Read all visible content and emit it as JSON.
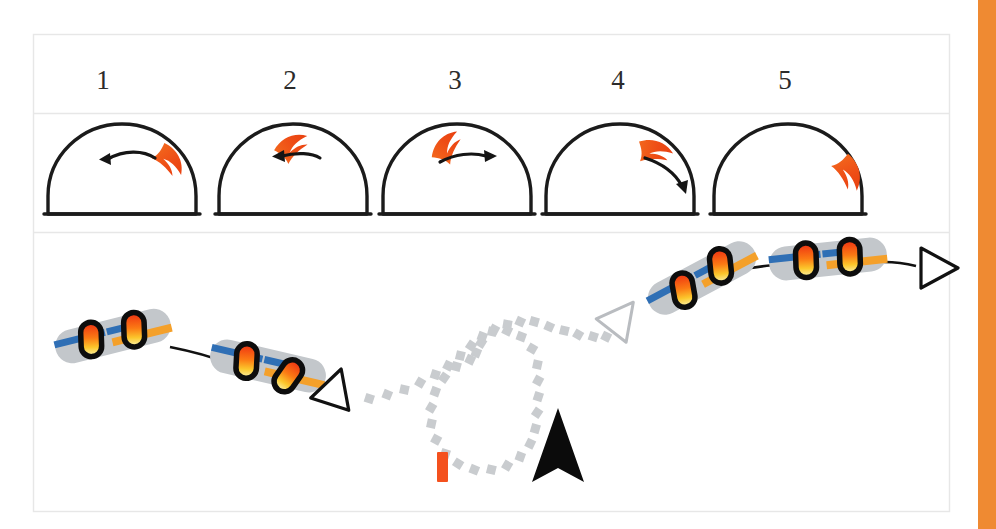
{
  "figure": {
    "background_color": "#ffffff",
    "accent_color": "#ef8a32"
  },
  "table": {
    "border_color": "#e7e7e7",
    "frame": {
      "x": 33,
      "y": 34,
      "width": 917,
      "height": 478
    },
    "row_divider_y": [
      113,
      232
    ],
    "header_row": {
      "name": "step-numbers",
      "cells": [
        {
          "label": "1",
          "cx": 103
        },
        {
          "label": "2",
          "cx": 290
        },
        {
          "label": "3",
          "cx": 455
        },
        {
          "label": "4",
          "cx": 618
        },
        {
          "label": "5",
          "cx": 785
        }
      ]
    }
  },
  "wind_window_row": {
    "name": "wind-window-domes",
    "dome_color": "#1b1b1b",
    "kite_color": "#ee5a1f",
    "arrow_color": "#151515",
    "cells": [
      {
        "step": "1",
        "kite_position": "right-of-zenith",
        "arrow_direction": "left",
        "description": "Kite right of zenith, steering arrow curving left toward zenith"
      },
      {
        "step": "2",
        "kite_position": "zenith",
        "arrow_direction": "left",
        "description": "Kite at zenith, arrow pointing left"
      },
      {
        "step": "3",
        "kite_position": "left-of-zenith",
        "arrow_direction": "right",
        "description": "Kite left of zenith, arrow pointing right"
      },
      {
        "step": "4",
        "kite_position": "upper-right",
        "arrow_direction": "down-right",
        "description": "Kite upper right, arrow curving down toward window edge"
      },
      {
        "step": "5",
        "kite_position": "right-edge",
        "arrow_direction": "none",
        "description": "Kite parked at right edge of wind window, no arrow"
      }
    ]
  },
  "track_row": {
    "name": "downwind-track-diagram",
    "board_colors": {
      "body": "#c3c7cb",
      "stripe_blue": "#2f6fb5",
      "stripe_orange": "#f4a02a",
      "rider_outline": "#0d0d0d",
      "rider_red": "#f03a12",
      "rider_orange": "#fb8c18",
      "rider_yellow": "#fbe33c"
    },
    "boards": [
      {
        "id": "board-1",
        "cx": 113,
        "cy": 336,
        "angle": -14,
        "riders": 2
      },
      {
        "id": "board-2",
        "cx": 268,
        "cy": 366,
        "angle": 13,
        "riders": 2
      },
      {
        "id": "board-3",
        "cx": 702,
        "cy": 278,
        "angle": -28,
        "riders": 2
      },
      {
        "id": "board-4",
        "cx": 828,
        "cy": 259,
        "angle": -6,
        "riders": 2
      }
    ],
    "markers": [
      {
        "id": "triangle-outbound",
        "type": "triangle-outline-black",
        "cx": 335,
        "cy": 388,
        "rotation": 20
      },
      {
        "id": "triangle-turn",
        "type": "triangle-outline-gray",
        "cx": 621,
        "cy": 318,
        "rotation": 35
      },
      {
        "id": "triangle-end",
        "type": "triangle-outline-black",
        "cx": 939,
        "cy": 268,
        "rotation": 0
      },
      {
        "id": "navigation-cursor",
        "type": "solid-chevron",
        "cx": 558,
        "cy": 448
      },
      {
        "id": "buoy-mark",
        "type": "bar",
        "cx": 443,
        "cy": 466,
        "color": "#f4511e"
      }
    ],
    "dotted_path": {
      "name": "jibe-loop-path",
      "style": "square-dots",
      "color": "#c9cccf",
      "description": "Dotted loop track from outbound triangle around the mark and back up to the turn triangle"
    }
  },
  "right_edge_bar": {
    "name": "page-accent-bar",
    "color": "#ef8a32",
    "x": 978,
    "width": 18
  }
}
